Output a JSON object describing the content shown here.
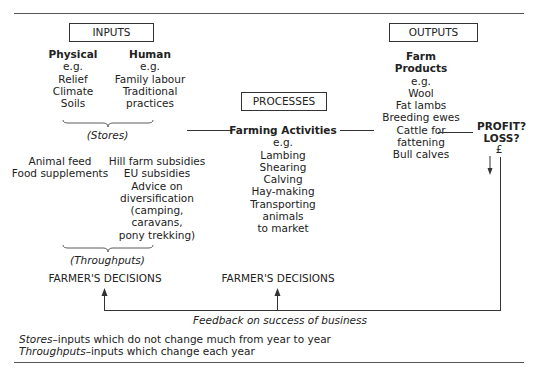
{
  "diagram": {
    "inputs": {
      "label": "INPUTS",
      "physical": {
        "title": "Physical",
        "items": [
          "e.g.",
          "Relief",
          "Climate",
          "Soils"
        ]
      },
      "human": {
        "title": "Human",
        "items": [
          "e.g.",
          "Family labour",
          "Traditional",
          "practices"
        ]
      },
      "stores_label": "(Stores)",
      "throughputs_left": [
        "Animal feed",
        "Food supplements"
      ],
      "throughputs_right": [
        "Hill farm subsidies",
        "EU subsidies",
        "Advice on",
        "diversification",
        "(camping,",
        "caravans,",
        "pony trekking)"
      ],
      "throughputs_label": "(Throughputs)"
    },
    "processes": {
      "label": "PROCESSES",
      "title": "Farming Activities",
      "items": [
        "e.g.",
        "Lambing",
        "Shearing",
        "Calving",
        "Hay-making",
        "Transporting",
        "animals",
        "to market"
      ]
    },
    "outputs": {
      "label": "OUTPUTS",
      "title": [
        "Farm",
        "Products"
      ],
      "items": [
        "e.g.",
        "Wool",
        "Fat lambs",
        "Breeding ewes",
        "Cattle for",
        "fattening",
        "Bull calves"
      ]
    },
    "result": {
      "lines": [
        "PROFIT?",
        "LOSS?"
      ],
      "currency": "£"
    },
    "decisions": [
      "FARMER'S DECISIONS",
      "FARMER'S DECISIONS"
    ],
    "feedback_label": "Feedback on success of business",
    "legend": [
      {
        "term": "Stores",
        "definition": "–inputs which do not change much from year to year"
      },
      {
        "term": "Throughputs",
        "definition": "–inputs which change each year"
      }
    ]
  }
}
